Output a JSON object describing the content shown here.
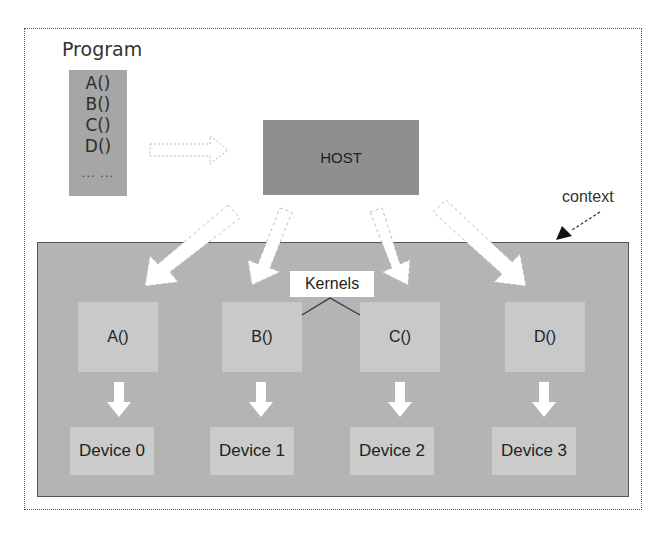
{
  "program": {
    "title": "Program",
    "items": [
      "A()",
      "B()",
      "C()",
      "D()"
    ],
    "ellipsis": "... ..."
  },
  "host": {
    "label": "HOST"
  },
  "context": {
    "label": "context"
  },
  "kernels_label": "Kernels",
  "kernels": [
    {
      "label": "A()"
    },
    {
      "label": "B()"
    },
    {
      "label": "C()"
    },
    {
      "label": "D()"
    }
  ],
  "devices": [
    {
      "label": "Device 0"
    },
    {
      "label": "Device 1"
    },
    {
      "label": "Device 2"
    },
    {
      "label": "Device 3"
    }
  ],
  "colors": {
    "program_box": "#a6a6a6",
    "host_box": "#8f8f8f",
    "context_area": "#b4b4b4",
    "kernel_box": "#c9c9c9",
    "device_box": "#cbcbcb",
    "arrow_fill": "#ffffff"
  }
}
